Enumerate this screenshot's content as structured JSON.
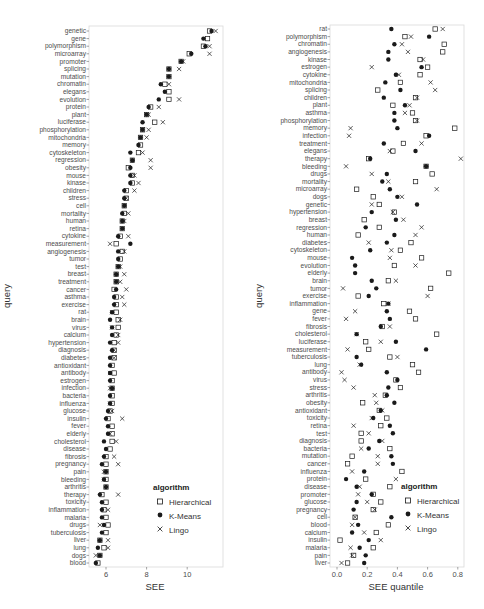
{
  "chart_data": [
    {
      "type": "scatter",
      "title": "",
      "xlabel": "SEE",
      "ylabel": "query",
      "xlim": [
        5.2,
        11.6
      ],
      "xticks": [
        6,
        8,
        10
      ],
      "grid": false,
      "legend": {
        "title": "algorithm",
        "position": "inside-bottom-right",
        "entries": [
          "Hierarchical",
          "K-Means",
          "Lingo"
        ]
      },
      "categories": [
        "genetic",
        "gene",
        "polymorphism",
        "microarray",
        "promoter",
        "splicing",
        "mutation",
        "chromatin",
        "elegans",
        "evolution",
        "protein",
        "plant",
        "luciferase",
        "phosphorylation",
        "mitochondria",
        "memory",
        "cytoskeleton",
        "regression",
        "obesity",
        "mouse",
        "kinase",
        "children",
        "stress",
        "cell",
        "mortality",
        "human",
        "retina",
        "cytokine",
        "measurement",
        "angiogenesis",
        "tumor",
        "test",
        "breast",
        "treatment",
        "cancer",
        "asthma",
        "exercise",
        "rat",
        "brain",
        "virus",
        "calcium",
        "hypertension",
        "diagnosis",
        "diabetes",
        "antioxidant",
        "antibody",
        "estrogen",
        "infection",
        "bacteria",
        "influenza",
        "glucose",
        "insulin",
        "fever",
        "elderly",
        "cholesterol",
        "disease",
        "fibrosis",
        "pregnancy",
        "pain",
        "bleeding",
        "arthritis",
        "therapy",
        "toxicity",
        "inflammation",
        "malaria",
        "drugs",
        "tuberculosis",
        "liver",
        "lung",
        "dogs",
        "blood"
      ],
      "series": [
        {
          "name": "Hierarchical",
          "marker": "square-open",
          "values": [
            11.1,
            11.0,
            10.8,
            10.1,
            9.7,
            9.1,
            9.1,
            8.9,
            9.1,
            9.1,
            8.2,
            8.0,
            8.4,
            7.8,
            7.7,
            7.7,
            7.6,
            7.3,
            7.1,
            7.3,
            7.3,
            7.0,
            7.0,
            6.9,
            6.9,
            6.8,
            6.8,
            6.7,
            6.5,
            6.8,
            6.7,
            6.6,
            6.5,
            6.5,
            6.4,
            6.5,
            6.5,
            6.5,
            6.6,
            6.6,
            6.5,
            6.4,
            6.4,
            6.4,
            6.3,
            6.4,
            6.3,
            6.3,
            6.3,
            6.3,
            6.2,
            6.1,
            6.3,
            6.3,
            6.3,
            6.2,
            6.0,
            6.0,
            6.0,
            6.0,
            6.0,
            5.8,
            6.0,
            5.9,
            6.0,
            6.1,
            6.0,
            5.7,
            5.9,
            5.7,
            5.6
          ]
        },
        {
          "name": "K-Means",
          "marker": "circle-filled",
          "values": [
            11.2,
            10.8,
            10.9,
            10.2,
            9.7,
            9.1,
            9.1,
            8.7,
            8.9,
            8.6,
            8.1,
            8.0,
            7.8,
            7.8,
            7.7,
            7.6,
            7.2,
            7.3,
            7.2,
            7.2,
            7.2,
            6.9,
            6.9,
            6.9,
            6.8,
            6.8,
            6.8,
            6.6,
            7.2,
            6.6,
            6.6,
            6.6,
            6.5,
            6.5,
            6.5,
            6.4,
            6.4,
            6.3,
            6.2,
            6.3,
            6.3,
            6.2,
            6.3,
            6.2,
            6.2,
            6.2,
            6.2,
            6.3,
            6.2,
            6.2,
            6.1,
            6.0,
            6.1,
            6.1,
            5.9,
            6.0,
            5.9,
            5.8,
            6.0,
            5.9,
            6.0,
            5.7,
            5.8,
            5.8,
            5.8,
            5.9,
            5.8,
            5.7,
            5.6,
            5.7,
            5.5
          ]
        },
        {
          "name": "Lingo",
          "marker": "x",
          "values": [
            11.4,
            null,
            11.1,
            11.1,
            9.8,
            9.6,
            null,
            9.1,
            null,
            9.6,
            8.6,
            8.1,
            8.8,
            8.1,
            8.0,
            null,
            7.8,
            8.2,
            8.2,
            7.4,
            7.6,
            7.4,
            7.0,
            null,
            7.1,
            6.9,
            null,
            7.1,
            6.2,
            6.9,
            null,
            6.7,
            6.9,
            6.7,
            7.0,
            6.8,
            6.9,
            6.3,
            6.7,
            6.3,
            6.6,
            6.6,
            6.4,
            6.4,
            null,
            6.2,
            null,
            6.2,
            null,
            6.2,
            6.3,
            6.8,
            null,
            6.2,
            6.5,
            null,
            6.4,
            6.6,
            5.9,
            5.9,
            null,
            6.6,
            null,
            6.1,
            null,
            5.7,
            null,
            6.1,
            6.1,
            5.5,
            null
          ]
        }
      ]
    },
    {
      "type": "scatter",
      "title": "",
      "xlabel": "SEE quantile",
      "ylabel": "query",
      "xlim": [
        -0.03,
        0.84
      ],
      "xticks": [
        0.0,
        0.2,
        0.4,
        0.6,
        0.8
      ],
      "grid": false,
      "legend": {
        "title": "algorithm",
        "position": "inside-bottom-right",
        "entries": [
          "Hierarchical",
          "K-Means",
          "Lingo"
        ]
      },
      "categories": [
        "rat",
        "polymorphism",
        "chromatin",
        "angiogenesis",
        "kinase",
        "estrogen",
        "cytokine",
        "mitochondria",
        "splicing",
        "children",
        "plant",
        "asthma",
        "phosphorylation",
        "memory",
        "infection",
        "treatment",
        "elegans",
        "therapy",
        "bleeding",
        "drugs",
        "mortality",
        "microarray",
        "dogs",
        "genetic",
        "hypertension",
        "breast",
        "regression",
        "human",
        "diabetes",
        "cytoskeleton",
        "mouse",
        "evolution",
        "elderly",
        "brain",
        "tumor",
        "exercise",
        "inflammation",
        "gene",
        "fever",
        "fibrosis",
        "cholesterol",
        "luciferase",
        "measurement",
        "tuberculosis",
        "lung",
        "antibody",
        "virus",
        "stress",
        "arthritis",
        "obesity",
        "antioxidant",
        "toxicity",
        "retina",
        "test",
        "diagnosis",
        "bacteria",
        "mutation",
        "cancer",
        "influenza",
        "protein",
        "disease",
        "promoter",
        "glucose",
        "pregnancy",
        "cell",
        "blood",
        "calcium",
        "insulin",
        "malaria",
        "pain",
        "liver"
      ],
      "series": [
        {
          "name": "Hierarchical",
          "marker": "square-open",
          "values": [
            0.65,
            0.45,
            0.71,
            0.7,
            0.55,
            0.6,
            0.55,
            0.42,
            0.27,
            0.52,
            0.37,
            0.5,
            0.52,
            0.78,
            0.59,
            0.44,
            0.37,
            0.21,
            0.59,
            0.63,
            0.52,
            0.13,
            0.24,
            0.28,
            0.38,
            0.18,
            0.28,
            0.14,
            0.49,
            0.42,
            0.56,
            0.38,
            0.74,
            0.34,
            0.62,
            0.14,
            0.31,
            0.48,
            0.52,
            0.3,
            0.66,
            0.19,
            0.21,
            0.35,
            0.5,
            0.54,
            0.39,
            0.42,
            0.32,
            0.17,
            0.28,
            0.33,
            0.29,
            0.16,
            0.16,
            0.35,
            0.1,
            0.07,
            0.43,
            0.19,
            0.35,
            0.24,
            0.29,
            0.24,
            0.12,
            0.34,
            0.26,
            0.02,
            0.24,
            0.11,
            0.07
          ]
        },
        {
          "name": "K-Means",
          "marker": "circle-filled",
          "values": [
            0.36,
            0.61,
            0.38,
            0.34,
            0.34,
            0.56,
            0.39,
            0.32,
            0.42,
            0.31,
            0.45,
            0.38,
            0.38,
            0.4,
            0.61,
            0.31,
            0.52,
            0.22,
            0.59,
            0.33,
            0.3,
            0.35,
            0.4,
            0.53,
            0.23,
            0.39,
            0.19,
            0.38,
            0.33,
            0.22,
            0.1,
            0.12,
            0.12,
            0.23,
            0.26,
            0.21,
            0.34,
            0.33,
            0.35,
            0.29,
            0.13,
            0.39,
            0.59,
            0.13,
            0.16,
            0.33,
            0.4,
            0.34,
            0.33,
            0.38,
            0.29,
            0.24,
            0.35,
            0.37,
            0.28,
            0.21,
            0.36,
            0.37,
            0.18,
            0.06,
            0.13,
            0.23,
            0.13,
            0.11,
            0.36,
            0.14,
            0.1,
            0.21,
            0.15,
            0.19,
            0.18
          ]
        },
        {
          "name": "Lingo",
          "marker": "x",
          "values": [
            0.7,
            0.49,
            0.43,
            0.47,
            0.57,
            0.23,
            0.41,
            0.62,
            0.65,
            0.53,
            0.48,
            0.45,
            0.53,
            0.09,
            0.08,
            0.56,
            0.35,
            0.82,
            0.06,
            0.23,
            0.34,
            0.66,
            0.43,
            0.23,
            0.37,
            0.44,
            0.56,
            0.52,
            0.21,
            0.36,
            0.35,
            0.52,
            null,
            0.39,
            0.04,
            0.6,
            0.34,
            0.12,
            0.06,
            0.35,
            0.13,
            0.29,
            0.07,
            0.4,
            0.15,
            0.03,
            0.05,
            0.11,
            0.25,
            0.26,
            0.3,
            0.23,
            0.11,
            0.21,
            0.3,
            0.16,
            0.27,
            0.27,
            0.1,
            0.39,
            0.15,
            0.14,
            0.2,
            0.25,
            0.12,
            0.1,
            0.18,
            0.29,
            0.09,
            0.1,
            0.03
          ]
        }
      ]
    }
  ],
  "panels": {
    "left": {
      "xlabel": "SEE",
      "ylabel": "query",
      "tick_labels": [
        "6",
        "8",
        "10"
      ]
    },
    "right": {
      "xlabel": "SEE quantile",
      "ylabel": "query",
      "tick_labels": [
        "0.0",
        "0.2",
        "0.4",
        "0.6",
        "0.8"
      ]
    }
  },
  "legend": {
    "title": "algorithm",
    "items": [
      {
        "label": "Hierarchical",
        "icon": "open-square-icon"
      },
      {
        "label": "K-Means",
        "icon": "filled-circle-icon"
      },
      {
        "label": "Lingo",
        "icon": "x-mark-icon"
      }
    ]
  },
  "colors": {
    "marker": "#1a1a1a",
    "panel_border": "#d9d9d9",
    "text": "#4d4d4d",
    "tick": "#666666"
  }
}
